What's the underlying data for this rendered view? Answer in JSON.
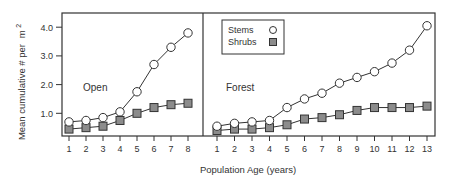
{
  "chart_data": {
    "type": "line",
    "title": "",
    "xlabel": "Population Age (years)",
    "ylabel": "Mean cumulative # per m²",
    "ylabel_main": "Mean cumulative # per",
    "ylabel_unit": "m",
    "ylabel_sup": "2",
    "ylim": [
      0,
      4.5
    ],
    "yticks": [
      "1.0",
      "2.0",
      "3.0",
      "4.0"
    ],
    "ytick_values": [
      1,
      2,
      3,
      4
    ],
    "grid": false,
    "legend": {
      "position": "upper-left of Forest panel",
      "entries": [
        "Stems",
        "Shrubs"
      ]
    },
    "panels": [
      {
        "name": "Open",
        "label": "Open",
        "x": [
          1,
          2,
          3,
          4,
          5,
          6,
          7,
          8
        ],
        "series": [
          {
            "name": "Stems",
            "marker": "open-circle",
            "values": [
              0.7,
              0.75,
              0.85,
              1.05,
              1.75,
              2.7,
              3.3,
              3.8
            ]
          },
          {
            "name": "Shrubs",
            "marker": "gray-square",
            "values": [
              0.45,
              0.5,
              0.55,
              0.75,
              1.0,
              1.2,
              1.3,
              1.35
            ]
          }
        ]
      },
      {
        "name": "Forest",
        "label": "Forest",
        "x": [
          1,
          2,
          3,
          4,
          5,
          6,
          7,
          8,
          9,
          10,
          11,
          12,
          13
        ],
        "series": [
          {
            "name": "Stems",
            "marker": "open-circle",
            "values": [
              0.55,
              0.65,
              0.7,
              0.75,
              1.2,
              1.5,
              1.7,
              2.05,
              2.25,
              2.45,
              2.75,
              3.2,
              4.05
            ]
          },
          {
            "name": "Shrubs",
            "marker": "gray-square",
            "values": [
              0.4,
              0.45,
              0.45,
              0.5,
              0.6,
              0.8,
              0.85,
              0.95,
              1.1,
              1.2,
              1.2,
              1.2,
              1.25
            ]
          }
        ]
      }
    ]
  },
  "colors": {
    "axis": "#333333",
    "line": "#333333",
    "circle_fill": "#ffffff",
    "square_fill": "#8c8c8c"
  }
}
